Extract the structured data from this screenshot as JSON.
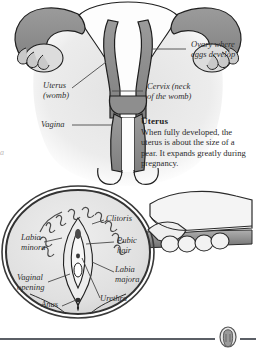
{
  "page": {
    "background_color": "#ffffff",
    "edge_mark": "a"
  },
  "top_figure": {
    "name": "female-reproductive-organs-diagram",
    "labels": [
      {
        "id": "ovary",
        "text": "Ovary where\neggs develop",
        "x": 191,
        "y": 44
      },
      {
        "id": "cervix",
        "text": "Cervix (neck\nof the womb)",
        "x": 147,
        "y": 86
      },
      {
        "id": "uterus",
        "text": "Uterus\n(womb)",
        "x": 43,
        "y": 85
      },
      {
        "id": "vagina",
        "text": "Vagina",
        "x": 41,
        "y": 122
      }
    ],
    "note": {
      "heading": "Uterus",
      "body": "When fully developed, the uterus is about the size of a pear. It expands greatly during pregnancy."
    },
    "colors": {
      "tube_fill": "#8e8e8e",
      "tube_stroke": "#1f1f1f",
      "ovary_fill": "#d9d9d9",
      "cavity_fill": "#fdfdfd",
      "body_silhouette": "#e6e6e6"
    }
  },
  "bottom_figure": {
    "name": "vulva-magnifier-diagram",
    "labels": [
      {
        "id": "clitoris",
        "text": "Clitoris",
        "x": 106,
        "y": 218
      },
      {
        "id": "pubic-hair",
        "text": "Pubic\nhair",
        "x": 117,
        "y": 239
      },
      {
        "id": "labia-majora",
        "text": "Labia\nmajora",
        "x": 115,
        "y": 268
      },
      {
        "id": "urethra",
        "text": "Urethra",
        "x": 100,
        "y": 296
      },
      {
        "id": "labia-minora",
        "text": "Labia\nminora",
        "x": 21,
        "y": 236
      },
      {
        "id": "vaginal-opening",
        "text": "Vaginal\nopening",
        "x": 17,
        "y": 276
      },
      {
        "id": "anus",
        "text": "Anus",
        "x": 41,
        "y": 302
      }
    ],
    "colors": {
      "lens_fill": "#e4e4e4",
      "lens_rim": "#333333",
      "handle_fill": "#9a9a9a",
      "hand_fill": "#f2f2f2",
      "hand_stroke": "#2a2a2a"
    }
  },
  "footer": {
    "rule_color": "#5b5f66",
    "medallion_name": "decorative-medallion"
  }
}
